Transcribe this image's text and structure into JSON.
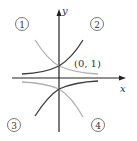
{
  "diagram": {
    "axes": {
      "x_label": "x",
      "y_label": "y"
    },
    "point_label": "(0, 1)",
    "quadrant_labels": [
      "1",
      "2",
      "3",
      "4"
    ],
    "curves": [
      {
        "id": "1",
        "description": "decreasing exponential through (0,1), above x-axis",
        "color": "#b0b0b0"
      },
      {
        "id": "2",
        "description": "increasing exponential through (0,1), above x-axis",
        "color": "#3a3a3a"
      },
      {
        "id": "3",
        "description": "reflected exponential through (0,-1), below x-axis, light",
        "color": "#b0b0b0"
      },
      {
        "id": "4",
        "description": "reflected exponential through (0,-1), below x-axis, dark",
        "color": "#3a3a3a"
      }
    ],
    "colors": {
      "axis": "#222222",
      "dark_curve": "#3a3a3a",
      "light_curve": "#b0b0b0"
    }
  }
}
